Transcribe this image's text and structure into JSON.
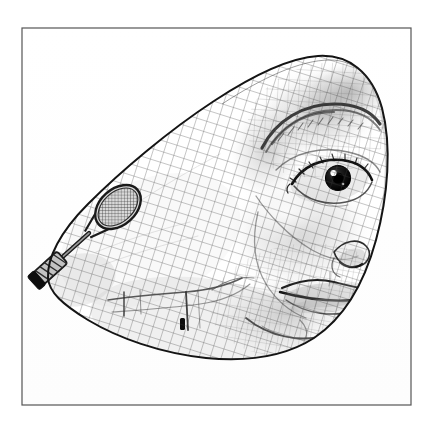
{
  "artwork": {
    "title": "Surrealist Face Distorted into Teardrop with Mesh Overlay",
    "style": "pen-and-ink engraving",
    "medium": "line engraving / hatching",
    "palette": {
      "background": "#ffffff",
      "plate_background": "#fefefe",
      "frame_stroke": "#555555",
      "outline_stroke": "#1a1a1a",
      "mesh_stroke": "#3a3a3a",
      "shading_dark": "#2b2b2b",
      "shading_mid": "#8a8a8a",
      "shading_light": "#c9c9c9",
      "iris": "#111111",
      "highlight": "#ffffff"
    },
    "frame": {
      "name": "plate-border",
      "x": 22,
      "y": 28,
      "width": 389,
      "height": 377,
      "stroke_width": 1.2
    },
    "subject": {
      "name": "distorted-face",
      "description": "Woman's face stretched into a teardrop/shuttlecock silhouette, apex pointing down-left",
      "bounds": {
        "x": 45,
        "y": 55,
        "width": 343,
        "height": 305
      }
    },
    "elements": [
      {
        "name": "mesh-overlay",
        "label": "Net / grid mesh",
        "spacing": 10.5,
        "angle": 18
      },
      {
        "name": "eye",
        "label": "Right eye",
        "cx": 330,
        "cy": 178
      },
      {
        "name": "eyebrow",
        "label": "Eyebrow arc",
        "cx": 318,
        "cy": 120
      },
      {
        "name": "nose",
        "label": "Nose and nostril",
        "cx": 350,
        "cy": 250
      },
      {
        "name": "lips",
        "label": "Lips",
        "cx": 330,
        "cy": 282
      },
      {
        "name": "chin",
        "label": "Chin and jaw contour",
        "cx": 300,
        "cy": 320
      },
      {
        "name": "tennis-racket",
        "label": "Tennis racket",
        "cx": 115,
        "cy": 205
      },
      {
        "name": "racket-handle",
        "label": "Racket handle and grip",
        "cx": 75,
        "cy": 255
      },
      {
        "name": "teardrop-tip",
        "label": "Pointed tip of teardrop",
        "cx": 50,
        "cy": 275
      }
    ]
  }
}
